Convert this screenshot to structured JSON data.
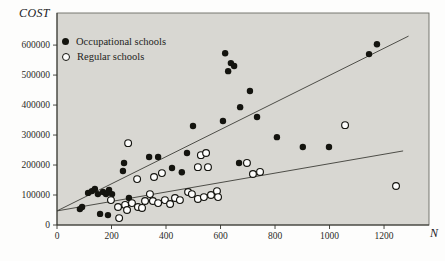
{
  "figure": {
    "y_axis_label": "COST",
    "x_axis_label": "N",
    "plot_bg": "#d8d7d2",
    "frame_color": "#6c6c65",
    "axis_color": "#35352f",
    "line_color": "#3d3d38",
    "point_color": "#14140f",
    "open_fill": "#fdfdfc"
  },
  "legend": {
    "items": [
      {
        "marker": "filled-circle",
        "label": "Occupational schools"
      },
      {
        "marker": "open-circle",
        "label": "Regular schools"
      }
    ]
  },
  "chart_data": {
    "type": "scatter",
    "title": "",
    "xlabel": "N",
    "ylabel": "COST",
    "xlim": [
      0,
      1365
    ],
    "ylim": [
      0,
      707000
    ],
    "x_ticks": [
      0,
      200,
      400,
      600,
      800,
      1000,
      1200
    ],
    "y_ticks": [
      0,
      100000,
      200000,
      300000,
      400000,
      500000,
      600000
    ],
    "grid": false,
    "legend_position": "top-left",
    "series": [
      {
        "name": "Occupational schools",
        "marker": "filled",
        "points": [
          [
            84,
            53000
          ],
          [
            92,
            60000
          ],
          [
            114,
            107000
          ],
          [
            128,
            113000
          ],
          [
            139,
            120000
          ],
          [
            150,
            103000
          ],
          [
            169,
            110000
          ],
          [
            180,
            103000
          ],
          [
            191,
            117000
          ],
          [
            202,
            103000
          ],
          [
            158,
            37000
          ],
          [
            187,
            33000
          ],
          [
            242,
            180000
          ],
          [
            246,
            207000
          ],
          [
            264,
            90000
          ],
          [
            338,
            227000
          ],
          [
            371,
            227000
          ],
          [
            422,
            190000
          ],
          [
            458,
            176000
          ],
          [
            477,
            240000
          ],
          [
            499,
            330000
          ],
          [
            609,
            347000
          ],
          [
            617,
            573000
          ],
          [
            628,
            513000
          ],
          [
            638,
            540000
          ],
          [
            650,
            530000
          ],
          [
            668,
            207000
          ],
          [
            672,
            393000
          ],
          [
            708,
            447000
          ],
          [
            734,
            360000
          ],
          [
            807,
            293000
          ],
          [
            902,
            260000
          ],
          [
            998,
            260000
          ],
          [
            1145,
            570000
          ],
          [
            1174,
            603000
          ]
        ]
      },
      {
        "name": "Regular schools",
        "marker": "open",
        "points": [
          [
            198,
            83000
          ],
          [
            224,
            60000
          ],
          [
            228,
            23000
          ],
          [
            250,
            67000
          ],
          [
            257,
            50000
          ],
          [
            261,
            273000
          ],
          [
            275,
            73000
          ],
          [
            294,
            153000
          ],
          [
            297,
            60000
          ],
          [
            312,
            57000
          ],
          [
            323,
            80000
          ],
          [
            341,
            103000
          ],
          [
            352,
            80000
          ],
          [
            356,
            160000
          ],
          [
            371,
            73000
          ],
          [
            385,
            173000
          ],
          [
            396,
            83000
          ],
          [
            415,
            70000
          ],
          [
            433,
            90000
          ],
          [
            451,
            83000
          ],
          [
            481,
            110000
          ],
          [
            495,
            103000
          ],
          [
            517,
            87000
          ],
          [
            517,
            193000
          ],
          [
            528,
            233000
          ],
          [
            539,
            93000
          ],
          [
            547,
            240000
          ],
          [
            554,
            193000
          ],
          [
            565,
            100000
          ],
          [
            587,
            113000
          ],
          [
            591,
            93000
          ],
          [
            697,
            207000
          ],
          [
            719,
            170000
          ],
          [
            745,
            177000
          ],
          [
            1057,
            333000
          ],
          [
            1244,
            130000
          ]
        ]
      }
    ],
    "lines": [
      {
        "name": "occupational-fit",
        "x": [
          0,
          1290
        ],
        "y": [
          47000,
          630000
        ]
      },
      {
        "name": "regular-fit",
        "x": [
          0,
          1270
        ],
        "y": [
          47000,
          247000
        ]
      }
    ]
  }
}
